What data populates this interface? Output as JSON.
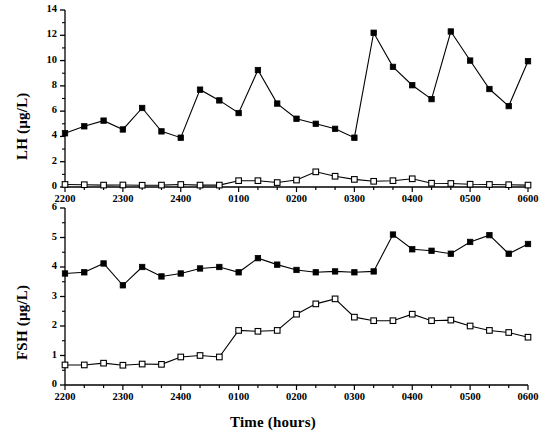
{
  "figure": {
    "xlabel": "Time (hours)",
    "background": "#ffffff",
    "line_color": "#000000",
    "filled_marker_color": "#000000",
    "open_marker_fill": "#ffffff"
  },
  "chart_data": [
    {
      "type": "line",
      "panel": "top",
      "title": "",
      "ylabel": "LH (µg/L)",
      "xlabel": "",
      "ylim": [
        0,
        14
      ],
      "yticks": [
        0,
        2,
        4,
        6,
        8,
        10,
        12,
        14
      ],
      "ytick_labels": [
        "0",
        "2",
        "4",
        "6",
        "8",
        "10",
        "12",
        "14"
      ],
      "xlim": [
        "2200",
        "0600"
      ],
      "xticks": [
        "2200",
        "2300",
        "2400",
        "0100",
        "0200",
        "0300",
        "0400",
        "0500",
        "0600"
      ],
      "xtick_labels": [
        "2200",
        "2300",
        "2400",
        "0100",
        "0200",
        "0300",
        "0400",
        "0500",
        "0600"
      ],
      "minor_xticks_per_hour": 3,
      "grid": false,
      "legend": "none",
      "x": [
        0.0,
        0.55,
        1.1,
        1.65,
        2.2,
        2.75,
        3.3,
        3.85,
        4.4,
        4.95,
        5.5,
        6.05,
        6.6,
        7.15,
        7.7,
        8.25,
        8.8,
        9.35,
        9.9,
        10.45,
        11.0,
        11.55,
        12.1,
        12.65,
        13.2,
        13.75,
        14.3,
        14.85,
        15.4,
        15.95,
        16.5,
        17.05,
        17.6,
        18.15,
        18.7,
        19.25,
        19.8,
        20.35,
        20.9,
        21.45,
        22.0,
        22.55,
        23.1,
        23.65,
        24.0
      ],
      "series": [
        {
          "name": "LH filled",
          "marker": "filled-square",
          "values": [
            4.25,
            4.8,
            5.25,
            4.55,
            6.25,
            4.4,
            3.9,
            7.7,
            6.85,
            5.85,
            9.25,
            6.6,
            5.4,
            5.0,
            4.6,
            3.9,
            12.2,
            9.5,
            8.05,
            6.95,
            12.3,
            10.0,
            7.75,
            6.4,
            9.95
          ]
        },
        {
          "name": "LH open",
          "marker": "open-square",
          "values": [
            0.2,
            0.18,
            0.15,
            0.16,
            0.14,
            0.15,
            0.2,
            0.15,
            0.15,
            0.5,
            0.5,
            0.35,
            0.55,
            1.2,
            0.85,
            0.6,
            0.45,
            0.5,
            0.65,
            0.3,
            0.28,
            0.22,
            0.2,
            0.18,
            0.15
          ]
        }
      ]
    },
    {
      "type": "line",
      "panel": "bottom",
      "title": "",
      "ylabel": "FSH (µg/L)",
      "xlabel": "Time (hours)",
      "ylim": [
        0,
        6
      ],
      "yticks": [
        0,
        1,
        2,
        3,
        4,
        5,
        6
      ],
      "ytick_labels": [
        "0",
        "1",
        "2",
        "3",
        "4",
        "5",
        "6"
      ],
      "xlim": [
        "2200",
        "0600"
      ],
      "xticks": [
        "2200",
        "2300",
        "2400",
        "0100",
        "0200",
        "0300",
        "0400",
        "0500",
        "0600"
      ],
      "xtick_labels": [
        "2200",
        "2300",
        "2400",
        "0100",
        "0200",
        "0300",
        "0400",
        "0500",
        "0600"
      ],
      "minor_xticks_per_hour": 3,
      "grid": false,
      "legend": "none",
      "series": [
        {
          "name": "FSH filled",
          "marker": "filled-square",
          "values": [
            3.78,
            3.82,
            4.12,
            3.38,
            4.0,
            3.68,
            3.78,
            3.95,
            4.0,
            3.82,
            4.3,
            4.08,
            3.9,
            3.82,
            3.85,
            3.82,
            3.85,
            5.1,
            4.6,
            4.55,
            4.45,
            4.85,
            5.08,
            4.45,
            4.78
          ]
        },
        {
          "name": "FSH open",
          "marker": "open-square",
          "values": [
            0.68,
            0.68,
            0.74,
            0.67,
            0.71,
            0.7,
            0.95,
            1.0,
            0.95,
            1.85,
            1.82,
            1.85,
            2.4,
            2.75,
            2.92,
            2.3,
            2.18,
            2.18,
            2.4,
            2.18,
            2.2,
            2.0,
            1.85,
            1.78,
            1.62
          ]
        }
      ]
    }
  ]
}
